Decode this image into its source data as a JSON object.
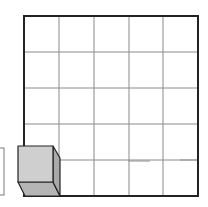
{
  "diagram": {
    "type": "grid-with-cube",
    "grid": {
      "rows": 5,
      "cols": 5,
      "x0": 24,
      "y0": 16,
      "x1": 198,
      "y1": 196,
      "border_color": "#222222",
      "line_color": "#8a8a8a"
    },
    "cube": {
      "position": "bottom-left cell",
      "front_face_color": "#cfcfcf",
      "side_face_color": "#a9a9a9",
      "bottom_face_color": "#b5b5b5",
      "edge_color": "#222222"
    },
    "faint_marks": [
      {
        "x1": 128,
        "x2": 150,
        "y": 161
      },
      {
        "x1": 180,
        "x2": 197,
        "y": 160
      }
    ],
    "left_fragment": {
      "x": 0,
      "y": 148,
      "width": 4,
      "height": 47,
      "color": "#7a7a7a"
    }
  }
}
